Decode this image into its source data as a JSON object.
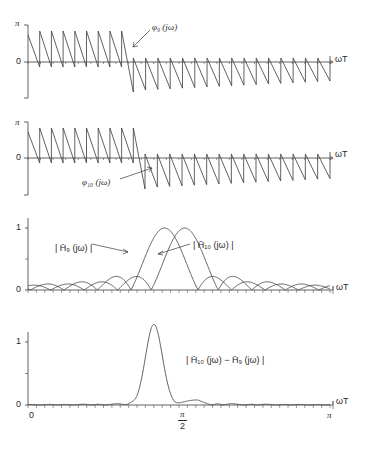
{
  "chart_data": [
    {
      "type": "line",
      "panel": 1,
      "title": "",
      "xlabel": "ωT",
      "ylabel": "",
      "y_ticks": [
        "π",
        "0"
      ],
      "ylim": [
        -3.1416,
        3.1416
      ],
      "xlim": [
        0,
        3.1416
      ],
      "annotation": "φ9(jω)",
      "series": [
        {
          "name": "φ9(jω)",
          "description": "sawtooth phase; ~8 teeth above 0 from 0 to ~π/2, then wraps below 0 with ~16 teeth to π",
          "teeth_positive": 8,
          "teeth_negative": 16
        }
      ]
    },
    {
      "type": "line",
      "panel": 2,
      "xlabel": "ωT",
      "y_ticks": [
        "π",
        "0"
      ],
      "ylim": [
        -3.1416,
        3.1416
      ],
      "xlim": [
        0,
        3.1416
      ],
      "annotation": "φ10(jω)",
      "series": [
        {
          "name": "φ10(jω)",
          "description": "sawtooth phase; ~9 teeth above 0 from 0 to ~π/2, then wraps below 0 with ~15 teeth to π",
          "teeth_positive": 9,
          "teeth_negative": 15
        }
      ]
    },
    {
      "type": "line",
      "panel": 3,
      "xlabel": "ωT",
      "y_ticks": [
        "1",
        "0"
      ],
      "ylim": [
        0,
        1.15
      ],
      "xlim": [
        0,
        3.1416
      ],
      "annotations": [
        "|H̄9(jω)|",
        "|H̄10(jω)|"
      ],
      "series": [
        {
          "name": "|H̄9(jω)|",
          "peak_x": 1.42,
          "peak_y": 1.0,
          "sidelobes": [
            0.24,
            0.15,
            0.1,
            0.07,
            0.05,
            0.04
          ]
        },
        {
          "name": "|H̄10(jω)|",
          "peak_x": 1.63,
          "peak_y": 1.0,
          "sidelobes": [
            0.24,
            0.15,
            0.1,
            0.07,
            0.05,
            0.04
          ]
        }
      ]
    },
    {
      "type": "line",
      "panel": 4,
      "xlabel": "ωT",
      "x_ticks": [
        "0",
        "π/2",
        "π"
      ],
      "y_ticks": [
        "1",
        "0"
      ],
      "ylim": [
        0,
        1.4
      ],
      "xlim": [
        0,
        3.1416
      ],
      "annotation": "|H̄10(jω) − H̄9(jω)|",
      "series": [
        {
          "name": "|H̄10(jω) − H̄9(jω)|",
          "peak_x": 1.31,
          "peak_y": 1.28,
          "sidelobes": [
            0.1,
            0.05,
            0.03,
            0.02
          ]
        }
      ]
    }
  ],
  "labels": {
    "p1": {
      "pi": "π",
      "zero": "0",
      "omegaT": "ωT",
      "curve": "φ₉ (jω)"
    },
    "p2": {
      "pi": "π",
      "zero": "0",
      "omegaT": "ωT",
      "curve": "φ₁₀ (jω)"
    },
    "p3": {
      "one": "1",
      "zero": "0",
      "omegaT": "ωT",
      "h9": "| H̄₉ (jω) |",
      "h10": "| H̄₁₀ (jω) |"
    },
    "p4": {
      "one": "1",
      "zero": "0",
      "omegaT": "ωT",
      "diff": "| H̄₁₀ (jω) − H̄₉ (jω) |",
      "x0": "0",
      "xpi2_num": "π",
      "xpi2_den": "2",
      "xpi": "π"
    }
  }
}
